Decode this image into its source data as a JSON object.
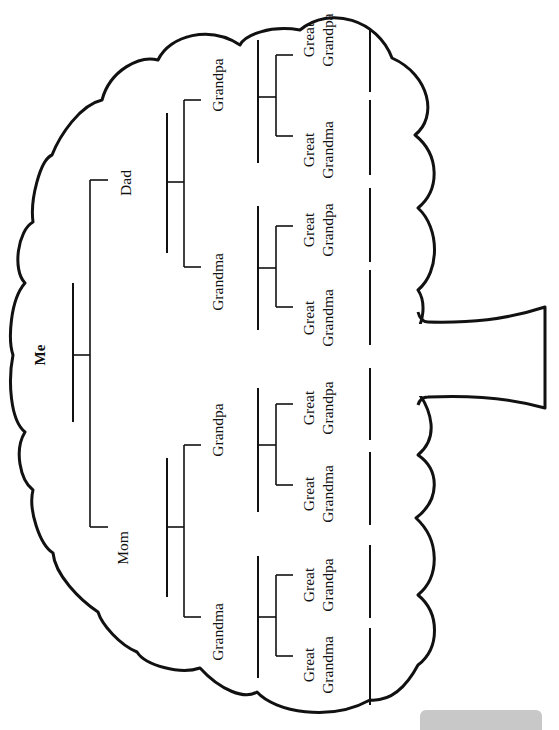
{
  "colors": {
    "ink": "#111111",
    "paper": "#ffffff",
    "tab": "#c8c8c8"
  },
  "people": {
    "me": "Me",
    "dad": "Dad",
    "mom": "Mom",
    "dad_side": {
      "grandpa": "Grandpa",
      "grandma": "Grandma"
    },
    "mom_side": {
      "grandpa": "Grandpa",
      "grandma": "Grandma"
    }
  },
  "great_grandparents": [
    {
      "line1": "Great",
      "line2": "Grandpa"
    },
    {
      "line1": "Great",
      "line2": "Grandma"
    },
    {
      "line1": "Great",
      "line2": "Grandpa"
    },
    {
      "line1": "Great",
      "line2": "Grandma"
    },
    {
      "line1": "Great",
      "line2": "Grandpa"
    },
    {
      "line1": "Great",
      "line2": "Grandma"
    },
    {
      "line1": "Great",
      "line2": "Grandpa"
    },
    {
      "line1": "Great",
      "line2": "Grandma"
    }
  ],
  "shapes": {
    "canopy": "cloud-canopy",
    "trunk": "tree-trunk"
  }
}
